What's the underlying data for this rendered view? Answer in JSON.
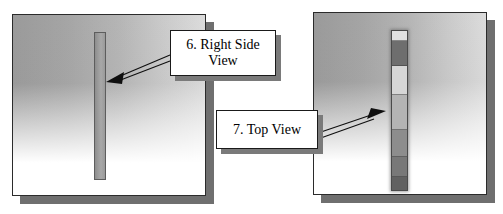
{
  "figure": {
    "type": "technical-illustration",
    "background_color": "#ffffff"
  },
  "panels": [
    {
      "id": "panel-left",
      "name": "right-side-view-panel",
      "x": 12,
      "y": 14,
      "width": 194,
      "height": 182,
      "border_color": "#2b2b2b",
      "shadow_color": "#6f6f6f",
      "gradient_from": "#9a9a9a",
      "gradient_to": "#ffffff",
      "specimen": {
        "name": "vertical-bar-uniform",
        "x": 81,
        "y": 17,
        "width": 12,
        "height": 148,
        "fill": "#9b9b9b",
        "outline": "#5d5d5d",
        "segments": []
      }
    },
    {
      "id": "panel-right",
      "name": "top-view-panel",
      "x": 313,
      "y": 12,
      "width": 174,
      "height": 183,
      "border_color": "#2b2b2b",
      "shadow_color": "#6f6f6f",
      "gradient_from": "#9a9a9a",
      "gradient_to": "#ffffff",
      "specimen": {
        "name": "vertical-bar-segmented",
        "x": 77,
        "y": 17,
        "width": 17,
        "height": 161,
        "fill": "#b0b0b0",
        "outline": "#4a4a4a",
        "segments": [
          {
            "label": "top-cap-light",
            "height_pct": 6,
            "color": "#e2e2e2"
          },
          {
            "label": "upper-dark-band",
            "height_pct": 16,
            "color": "#6e6e6e"
          },
          {
            "label": "mid-light-band",
            "height_pct": 18,
            "color": "#d6d6d6"
          },
          {
            "label": "mid-gradient-band",
            "height_pct": 22,
            "color": "#b4b4b4"
          },
          {
            "label": "lower-mid-band",
            "height_pct": 17,
            "color": "#8d8d8d"
          },
          {
            "label": "lower-dark-band",
            "height_pct": 13,
            "color": "#787878"
          },
          {
            "label": "bottom-cap-dark",
            "height_pct": 8,
            "color": "#616161"
          }
        ]
      }
    }
  ],
  "callouts": [
    {
      "id": "callout-6",
      "name": "callout-right-side-view",
      "text": "6. Right Side View",
      "line1": "6. Right Side",
      "line2": "View",
      "x": 170,
      "y": 30,
      "width": 106,
      "height": 46,
      "font_size": 14,
      "text_color": "#000000",
      "background": "#ffffff",
      "border_color": "#1a1a1a",
      "shadow_color": "#7a7a7a",
      "arrow": {
        "name": "leader-arrow-right-side-view",
        "from_x": 170,
        "from_y": 58,
        "to_x": 113,
        "to_y": 80,
        "direction": "down-left",
        "color": "#0f0f0f",
        "style": "double-line"
      }
    },
    {
      "id": "callout-7",
      "name": "callout-top-view",
      "text": "7. Top View",
      "line1": "7. Top View",
      "line2": "",
      "x": 216,
      "y": 110,
      "width": 102,
      "height": 39,
      "font_size": 14,
      "text_color": "#000000",
      "background": "#ffffff",
      "border_color": "#1a1a1a",
      "shadow_color": "#7a7a7a",
      "arrow": {
        "name": "leader-arrow-top-view",
        "from_x": 318,
        "from_y": 135,
        "to_x": 381,
        "to_y": 115,
        "direction": "up-right",
        "color": "#0f0f0f",
        "style": "double-line"
      }
    }
  ]
}
